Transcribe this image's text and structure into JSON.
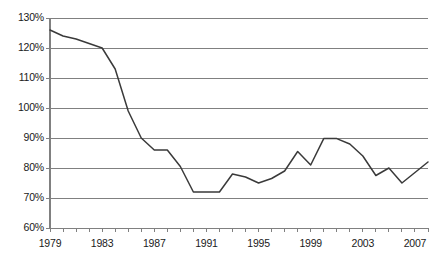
{
  "chart_data": {
    "type": "line",
    "title": "",
    "subtitle": "",
    "xlabel": "",
    "ylabel": "",
    "grid": "horizontal",
    "legend": "none",
    "xlim": [
      1979,
      2008
    ],
    "ylim": [
      60,
      130
    ],
    "ytick_labels": [
      "130%",
      "120%",
      "110%",
      "100%",
      "90%",
      "80%",
      "70%",
      "60%"
    ],
    "ytick_values": [
      130,
      120,
      110,
      100,
      90,
      80,
      70,
      60
    ],
    "xtick_labels": [
      "1979",
      "1983",
      "1987",
      "1991",
      "1995",
      "1999",
      "2003",
      "2007"
    ],
    "xtick_values": [
      1979,
      1983,
      1987,
      1991,
      1995,
      1999,
      2003,
      2007
    ],
    "x": [
      1979,
      1980,
      1981,
      1982,
      1983,
      1984,
      1985,
      1986,
      1987,
      1988,
      1989,
      1990,
      1991,
      1992,
      1993,
      1994,
      1995,
      1996,
      1997,
      1998,
      1999,
      2000,
      2001,
      2002,
      2003,
      2004,
      2005,
      2006,
      2007,
      2008
    ],
    "series": [
      {
        "name": "series-1",
        "color": "#3a3a3a",
        "values": [
          126,
          124,
          123,
          121.5,
          120,
          113,
          99,
          90,
          86,
          86,
          80.5,
          72,
          72,
          72,
          78,
          77,
          75,
          76.5,
          79,
          85.5,
          81,
          89.8,
          89.8,
          88,
          84,
          77.5,
          80,
          75,
          78.5,
          82
        ]
      }
    ],
    "colors": {
      "line": "#3a3a3a",
      "grid": "#808080",
      "axis": "#808080",
      "text": "#1a1a1a",
      "background": "#ffffff"
    }
  }
}
